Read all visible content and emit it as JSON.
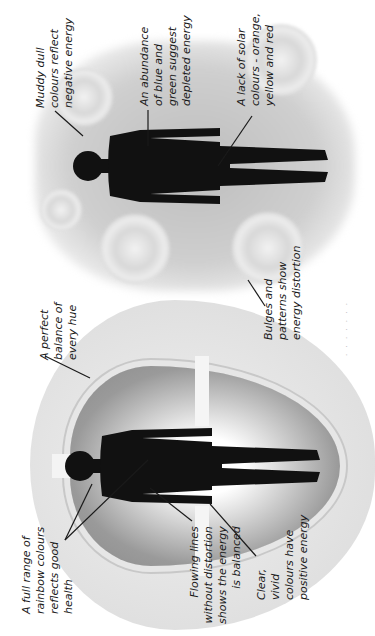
{
  "diagram": {
    "type": "aura comparison illustration",
    "orientation": "rotated 90 degrees counter-clockwise",
    "colors": {
      "background": "#ffffff",
      "figure": "#111111",
      "aura_light": "#e2e2e2",
      "aura_dark": "#8a8a8a",
      "leader_line": "#1a1a1a"
    },
    "healthy_aura": {
      "labels": {
        "perfect_balance": "A perfect\nbalance of\nevery hue",
        "full_range": "A full range of\nrainbow colours\nreflects good\nhealth",
        "flowing_lines": "Flowing lines\nwithout distortion\nshows the energy\nis balanced",
        "clear_vivid": "Clear,\nvivid\ncolours have\npositive energy"
      }
    },
    "distorted_aura": {
      "labels": {
        "muddy_dull": "Muddy dull\ncolours reflect\nnegative energy",
        "abundance_blue_green": "An abundance\nof blue and\ngreen suggest\ndepleted energy",
        "lack_solar": "A lack of solar\ncolours - orange,\nyellow and red",
        "bulges_patterns": "Bulges and\npatterns show\nenergy distortion"
      }
    }
  }
}
